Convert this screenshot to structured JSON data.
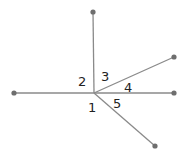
{
  "diagram": {
    "title": "",
    "center": {
      "x": 94,
      "y": 93
    },
    "colors": {
      "line": "#8a8a8a",
      "dot": "#6e6e6e",
      "text": "#222222"
    },
    "rays": [
      {
        "id": "up",
        "x": 93,
        "y": 12
      },
      {
        "id": "left",
        "x": 14,
        "y": 93
      },
      {
        "id": "right-up",
        "x": 174,
        "y": 57
      },
      {
        "id": "right",
        "x": 174,
        "y": 93
      },
      {
        "id": "down-right",
        "x": 155,
        "y": 146
      }
    ],
    "angle_labels": [
      {
        "text": "1",
        "x": 88,
        "y": 112
      },
      {
        "text": "2",
        "x": 78,
        "y": 86
      },
      {
        "text": "3",
        "x": 101,
        "y": 81
      },
      {
        "text": "4",
        "x": 124,
        "y": 92
      },
      {
        "text": "5",
        "x": 113,
        "y": 108
      }
    ]
  }
}
